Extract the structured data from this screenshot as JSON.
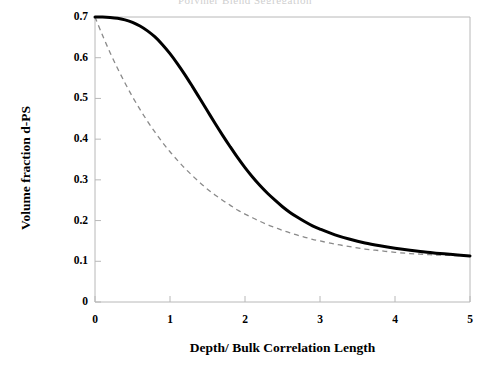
{
  "figure": {
    "background_color": "#ffffff",
    "frame_color": "#b8b8b8",
    "title_remnant": "Polymer Blend Segregation"
  },
  "chart_data": {
    "type": "line",
    "title": "",
    "xlabel": "Depth/ Bulk Correlation Length",
    "ylabel": "Volume fraction d-PS",
    "xlim": [
      0,
      5
    ],
    "ylim": [
      0,
      0.7
    ],
    "grid": false,
    "legend": "none",
    "xticks": [
      "0",
      "1",
      "2",
      "3",
      "4",
      "5"
    ],
    "xtick_values": [
      0,
      1,
      2,
      3,
      4,
      5
    ],
    "yticks": [
      "0",
      "0.1",
      "0.2",
      "0.3",
      "0.4",
      "0.5",
      "0.6",
      "0.7"
    ],
    "ytick_values": [
      0,
      0.1,
      0.2,
      0.3,
      0.4,
      0.5,
      0.6,
      0.7
    ],
    "x": [
      0,
      0.1,
      0.2,
      0.3,
      0.4,
      0.5,
      0.6,
      0.7,
      0.8,
      0.9,
      1.0,
      1.1,
      1.2,
      1.3,
      1.4,
      1.5,
      1.6,
      1.7,
      1.8,
      1.9,
      2.0,
      2.1,
      2.2,
      2.3,
      2.4,
      2.5,
      2.6,
      2.7,
      2.8,
      2.9,
      3.0,
      3.2,
      3.4,
      3.6,
      3.8,
      4.0,
      4.2,
      4.4,
      4.6,
      4.8,
      5.0
    ],
    "series": [
      {
        "name": "solid-curve",
        "style": "solid",
        "color": "#000000",
        "width": 3.0,
        "values": [
          0.7,
          0.7,
          0.699,
          0.697,
          0.693,
          0.687,
          0.678,
          0.666,
          0.651,
          0.632,
          0.61,
          0.585,
          0.558,
          0.529,
          0.499,
          0.469,
          0.439,
          0.41,
          0.382,
          0.355,
          0.33,
          0.307,
          0.286,
          0.267,
          0.25,
          0.234,
          0.22,
          0.208,
          0.197,
          0.187,
          0.179,
          0.165,
          0.154,
          0.145,
          0.138,
          0.132,
          0.127,
          0.123,
          0.119,
          0.116,
          0.113
        ]
      },
      {
        "name": "dashed-curve",
        "style": "dashed",
        "color": "#8a8a8a",
        "width": 1.3,
        "values": [
          0.7,
          0.655,
          0.613,
          0.574,
          0.538,
          0.504,
          0.473,
          0.444,
          0.417,
          0.392,
          0.369,
          0.348,
          0.328,
          0.31,
          0.293,
          0.277,
          0.263,
          0.25,
          0.238,
          0.226,
          0.216,
          0.207,
          0.198,
          0.19,
          0.183,
          0.176,
          0.17,
          0.164,
          0.159,
          0.154,
          0.15,
          0.142,
          0.136,
          0.13,
          0.126,
          0.122,
          0.119,
          0.117,
          0.115,
          0.114,
          0.113
        ]
      }
    ]
  }
}
